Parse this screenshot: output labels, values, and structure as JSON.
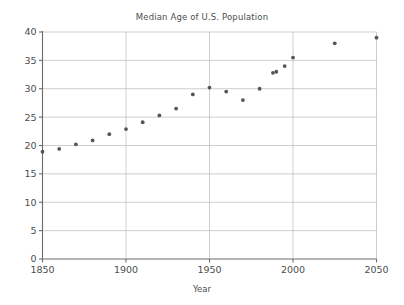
{
  "chart_data": {
    "type": "scatter",
    "title": "Median Age of U.S. Population",
    "xlabel": "Year",
    "ylabel": "",
    "xlim": [
      1850,
      2050
    ],
    "ylim": [
      0,
      40
    ],
    "xticks": [
      1850,
      1900,
      1950,
      2000,
      2050
    ],
    "xticklabels": [
      "1850",
      "1900",
      "1950",
      "2000",
      "2050"
    ],
    "yticks": [
      0,
      5,
      10,
      15,
      20,
      25,
      30,
      35,
      40
    ],
    "yticklabels": [
      "0",
      "5",
      "10",
      "15",
      "20",
      "25",
      "30",
      "35",
      "40"
    ],
    "grid": true,
    "legend": false,
    "marker": "circle",
    "marker_color": "#555555",
    "series": [
      {
        "name": "Median Age",
        "x": [
          1850,
          1860,
          1870,
          1880,
          1890,
          1900,
          1910,
          1920,
          1930,
          1940,
          1950,
          1960,
          1970,
          1980,
          1988,
          1990,
          1995,
          2000,
          2025,
          2050
        ],
        "y": [
          18.9,
          19.4,
          20.2,
          20.9,
          22.0,
          22.9,
          24.1,
          25.3,
          26.5,
          29.0,
          30.2,
          29.5,
          28.0,
          30.0,
          32.8,
          33.0,
          34.0,
          35.5,
          38.0,
          39.0
        ]
      }
    ]
  },
  "axes": {
    "x_tick_label_prefix": "",
    "y_tick_label_prefix": ""
  }
}
